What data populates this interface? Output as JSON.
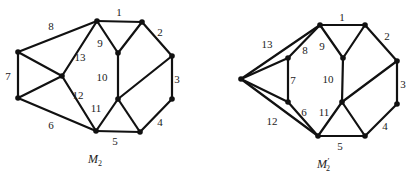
{
  "figures": [
    {
      "id": "m2",
      "caption": "M",
      "caption_sub": "2",
      "caption_prime": "",
      "caption_pos": [
        88,
        163
      ],
      "nodes": {
        "A": [
          97,
          21
        ],
        "B": [
          142,
          22
        ],
        "C": [
          172,
          56
        ],
        "D": [
          172,
          99
        ],
        "E": [
          140,
          132
        ],
        "F": [
          96,
          131
        ],
        "G": [
          18,
          98
        ],
        "H": [
          18,
          52
        ],
        "I": [
          62,
          76
        ],
        "J": [
          118,
          53
        ],
        "K": [
          118,
          99
        ]
      },
      "edges": [
        {
          "from": "A",
          "to": "B",
          "label": "1",
          "lpos": [
            119,
            16
          ]
        },
        {
          "from": "B",
          "to": "C",
          "label": "2",
          "lpos": [
            160,
            36
          ]
        },
        {
          "from": "C",
          "to": "D",
          "label": "3",
          "lpos": [
            177,
            83
          ]
        },
        {
          "from": "D",
          "to": "E",
          "label": "4",
          "lpos": [
            160,
            126
          ]
        },
        {
          "from": "F",
          "to": "E",
          "label": "5",
          "lpos": [
            115,
            145
          ]
        },
        {
          "from": "G",
          "to": "F",
          "label": "6",
          "lpos": [
            51,
            129
          ]
        },
        {
          "from": "H",
          "to": "G",
          "label": "7",
          "lpos": [
            8,
            80
          ]
        },
        {
          "from": "H",
          "to": "A",
          "label": "8",
          "lpos": [
            51,
            30
          ]
        },
        {
          "from": "A",
          "to": "J",
          "label": "9",
          "lpos": [
            100,
            47
          ]
        },
        {
          "from": "J",
          "to": "B",
          "label": "",
          "lpos": null
        },
        {
          "from": "J",
          "to": "K",
          "label": "10",
          "lpos": [
            102,
            81
          ]
        },
        {
          "from": "K",
          "to": "C",
          "label": "",
          "lpos": null
        },
        {
          "from": "F",
          "to": "K",
          "label": "11",
          "lpos": [
            96,
            112
          ]
        },
        {
          "from": "K",
          "to": "E",
          "label": "",
          "lpos": null
        },
        {
          "from": "I",
          "to": "F",
          "label": "12",
          "lpos": [
            78,
            99
          ]
        },
        {
          "from": "I",
          "to": "A",
          "label": "13",
          "lpos": [
            80,
            61
          ]
        },
        {
          "from": "H",
          "to": "I",
          "label": "",
          "lpos": null
        },
        {
          "from": "G",
          "to": "I",
          "label": "",
          "lpos": null
        }
      ]
    },
    {
      "id": "m2-prime",
      "caption": "M",
      "caption_sub": "2",
      "caption_prime": "′",
      "caption_pos": [
        317,
        168
      ],
      "nodes": {
        "A": [
          320,
          25
        ],
        "B": [
          365,
          25
        ],
        "C": [
          397,
          61
        ],
        "D": [
          397,
          104
        ],
        "E": [
          365,
          136
        ],
        "F": [
          318,
          136
        ],
        "J": [
          343,
          58
        ],
        "K": [
          342,
          102
        ],
        "P": [
          241,
          79
        ],
        "Q": [
          288,
          58
        ],
        "R": [
          288,
          102
        ]
      },
      "edges": [
        {
          "from": "A",
          "to": "B",
          "label": "1",
          "lpos": [
            342,
            21
          ]
        },
        {
          "from": "B",
          "to": "C",
          "label": "2",
          "lpos": [
            387,
            40
          ]
        },
        {
          "from": "C",
          "to": "D",
          "label": "3",
          "lpos": [
            403,
            88
          ]
        },
        {
          "from": "D",
          "to": "E",
          "label": "4",
          "lpos": [
            385,
            130
          ]
        },
        {
          "from": "F",
          "to": "E",
          "label": "5",
          "lpos": [
            340,
            150
          ]
        },
        {
          "from": "R",
          "to": "F",
          "label": "6",
          "lpos": [
            304,
            116
          ]
        },
        {
          "from": "Q",
          "to": "R",
          "label": "7",
          "lpos": [
            293,
            84
          ]
        },
        {
          "from": "Q",
          "to": "A",
          "label": "8",
          "lpos": [
            305,
            54
          ]
        },
        {
          "from": "A",
          "to": "J",
          "label": "9",
          "lpos": [
            322,
            50
          ]
        },
        {
          "from": "J",
          "to": "B",
          "label": "",
          "lpos": null
        },
        {
          "from": "J",
          "to": "K",
          "label": "10",
          "lpos": [
            328,
            83
          ]
        },
        {
          "from": "K",
          "to": "C",
          "label": "",
          "lpos": null
        },
        {
          "from": "F",
          "to": "K",
          "label": "11",
          "lpos": [
            324,
            116
          ]
        },
        {
          "from": "K",
          "to": "E",
          "label": "",
          "lpos": null
        },
        {
          "from": "P",
          "to": "F",
          "label": "12",
          "lpos": [
            272,
            125
          ]
        },
        {
          "from": "P",
          "to": "A",
          "label": "13",
          "lpos": [
            267,
            48
          ]
        },
        {
          "from": "P",
          "to": "Q",
          "label": "",
          "lpos": null
        },
        {
          "from": "P",
          "to": "R",
          "label": "",
          "lpos": null
        }
      ]
    }
  ]
}
